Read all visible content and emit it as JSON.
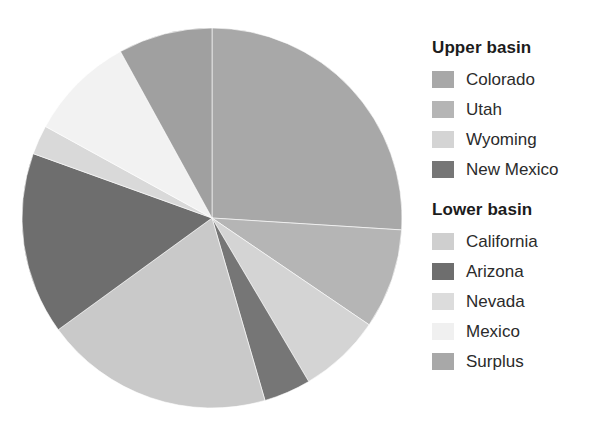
{
  "chart_data": {
    "type": "pie",
    "title": "",
    "xlabel": "",
    "ylabel": "",
    "legend_position": "right",
    "grid": false,
    "categories": [
      "Colorado",
      "Utah",
      "Wyoming",
      "New Mexico",
      "California",
      "Arizona",
      "Nevada",
      "Mexico",
      "Surplus"
    ],
    "values": [
      26.0,
      8.5,
      7.0,
      4.0,
      19.5,
      15.5,
      2.5,
      9.0,
      8.0
    ],
    "units": "percent",
    "start_angle_deg": 0,
    "direction": "clockwise",
    "slices": [
      {
        "label": "Colorado",
        "group": "Upper basin",
        "value": 26.0,
        "color": "#a8a8a8",
        "start_deg": 0.0,
        "end_deg": 93.6
      },
      {
        "label": "Utah",
        "group": "Upper basin",
        "value": 8.5,
        "color": "#b5b5b5",
        "start_deg": 93.6,
        "end_deg": 124.2
      },
      {
        "label": "Wyoming",
        "group": "Upper basin",
        "value": 7.0,
        "color": "#d4d4d4",
        "start_deg": 124.2,
        "end_deg": 149.4
      },
      {
        "label": "New Mexico",
        "group": "Upper basin",
        "value": 4.0,
        "color": "#767676",
        "start_deg": 149.4,
        "end_deg": 163.8
      },
      {
        "label": "California",
        "group": "Lower basin",
        "value": 19.5,
        "color": "#c9c9c9",
        "start_deg": 163.8,
        "end_deg": 234.0
      },
      {
        "label": "Arizona",
        "group": "Lower basin",
        "value": 15.5,
        "color": "#6e6e6e",
        "start_deg": 234.0,
        "end_deg": 289.8
      },
      {
        "label": "Nevada",
        "group": "Lower basin",
        "value": 2.5,
        "color": "#d9d9d9",
        "start_deg": 289.8,
        "end_deg": 298.8
      },
      {
        "label": "Mexico",
        "group": "Lower basin",
        "value": 9.0,
        "color": "#f2f2f2",
        "start_deg": 298.8,
        "end_deg": 331.2
      },
      {
        "label": "Surplus",
        "group": "Lower basin",
        "value": 8.0,
        "color": "#a0a0a0",
        "start_deg": 331.2,
        "end_deg": 360.0
      }
    ]
  },
  "legend": {
    "groups": [
      {
        "title": "Upper basin",
        "items": [
          {
            "label": "Colorado",
            "color": "#a8a8a8"
          },
          {
            "label": "Utah",
            "color": "#b5b5b5"
          },
          {
            "label": "Wyoming",
            "color": "#d4d4d4"
          },
          {
            "label": "New Mexico",
            "color": "#767676"
          }
        ]
      },
      {
        "title": "Lower basin",
        "items": [
          {
            "label": "California",
            "color": "#cfcfcf"
          },
          {
            "label": "Arizona",
            "color": "#6e6e6e"
          },
          {
            "label": "Nevada",
            "color": "#dcdcdc"
          },
          {
            "label": "Mexico",
            "color": "#f0f0f0"
          },
          {
            "label": "Surplus",
            "color": "#a8a8a8"
          }
        ]
      }
    ]
  },
  "colors": {
    "background": "#ffffff",
    "legend_title_text": "#1c1c1c",
    "legend_label_text": "#2b2b2b",
    "slice_edge": "#ffffff"
  }
}
